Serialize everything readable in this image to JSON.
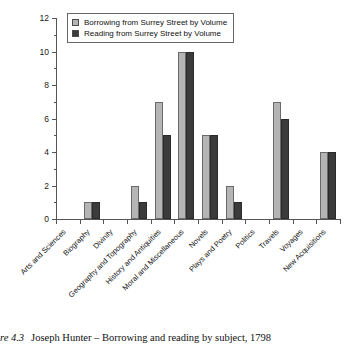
{
  "caption": {
    "number": "re 4.3",
    "text": "Joseph Hunter – Borrowing and reading by subject, 1798"
  },
  "legend": {
    "items": [
      {
        "label": "Borrowing from Surrey Street by Volume",
        "color": "#b5b5b5"
      },
      {
        "label": "Reading from Surrey Street by Volume",
        "color": "#3b3b3b"
      }
    ]
  },
  "axes": {
    "y_ticks": [
      "0",
      "2",
      "4",
      "6",
      "8",
      "10",
      "12"
    ],
    "y_minor_ticks": [
      "1",
      "3",
      "5",
      "7",
      "9",
      "11"
    ],
    "ylabel": "",
    "xlabel": ""
  },
  "chart_data": {
    "type": "bar",
    "title": "",
    "subtitle": "",
    "xlabel": "",
    "ylabel": "",
    "ylim": [
      0,
      12
    ],
    "ytick_step": 2,
    "grid": false,
    "legend_position": "top-left-inside",
    "categories": [
      "Arts and Sciences",
      "Biography",
      "Divinity",
      "Geography and Topography",
      "History and Antiquities",
      "Moral and Miscellaneous",
      "Novels",
      "Plays and Poetry",
      "Politics",
      "Travels",
      "Voyages",
      "New Acquisitions"
    ],
    "series": [
      {
        "name": "Borrowing from Surrey Street by Volume",
        "color": "#b5b5b5",
        "values": [
          0,
          1,
          0,
          2,
          7,
          10,
          5,
          2,
          0,
          7,
          0,
          4
        ]
      },
      {
        "name": "Reading from Surrey Street by Volume",
        "color": "#3b3b3b",
        "values": [
          0,
          1,
          0,
          1,
          5,
          10,
          5,
          1,
          0,
          6,
          0,
          4
        ]
      }
    ]
  }
}
